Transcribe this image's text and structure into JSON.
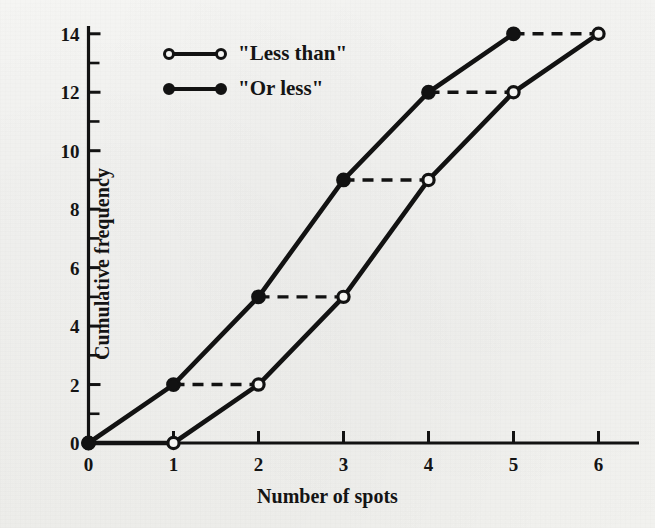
{
  "chart_data": {
    "type": "line",
    "title": "",
    "subtitle": "",
    "xlabel": "Number of spots",
    "ylabel": "Cumulative frequency",
    "xlim": [
      0,
      6.45
    ],
    "ylim": [
      0,
      14.6
    ],
    "x_ticks": [
      0,
      1,
      2,
      3,
      4,
      5,
      6
    ],
    "x_tick_labels": [
      "0",
      "1",
      "2",
      "3",
      "4",
      "5",
      "6"
    ],
    "y_ticks": [
      0,
      2,
      4,
      6,
      8,
      10,
      12,
      14
    ],
    "y_tick_labels": [
      "0",
      "2",
      "4",
      "6",
      "8",
      "10",
      "12",
      "14"
    ],
    "y_minor_ticks": [
      1,
      3,
      5,
      7,
      9,
      11,
      13
    ],
    "grid": false,
    "legend_position": "top-left",
    "series": [
      {
        "name": "\"Less than\"",
        "marker": "open-circle",
        "linestyle": "solid",
        "color": "#121212",
        "x": [
          0,
          1,
          2,
          3,
          4,
          5,
          6
        ],
        "values": [
          0,
          0,
          2,
          5,
          9,
          12,
          14
        ]
      },
      {
        "name": "\"Or less\"",
        "marker": "filled-circle",
        "linestyle": "solid",
        "color": "#121212",
        "x": [
          0,
          1,
          2,
          3,
          4,
          5
        ],
        "values": [
          0,
          2,
          5,
          9,
          12,
          14
        ]
      }
    ],
    "connectors": {
      "linestyle": "dashed",
      "color": "#121212",
      "segments": [
        {
          "y": 0,
          "x_from": 0,
          "x_to": 1
        },
        {
          "y": 2,
          "x_from": 1,
          "x_to": 2
        },
        {
          "y": 5,
          "x_from": 2,
          "x_to": 3
        },
        {
          "y": 9,
          "x_from": 3,
          "x_to": 4
        },
        {
          "y": 12,
          "x_from": 4,
          "x_to": 5
        },
        {
          "y": 14,
          "x_from": 5,
          "x_to": 6
        }
      ]
    }
  },
  "legend": {
    "items": [
      {
        "label": "\"Less than\"",
        "marker": "open-circle"
      },
      {
        "label": "\"Or less\"",
        "marker": "filled-circle"
      }
    ]
  },
  "axes": {
    "x_title": "Number of spots",
    "y_title": "Cumulative frequency"
  }
}
